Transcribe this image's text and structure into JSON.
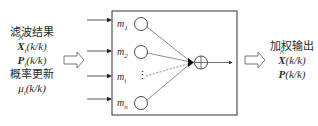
{
  "input": {
    "line1": "滤波结果",
    "x_symbol": "X",
    "x_sub": "i",
    "x_arg": "(k/k)",
    "p_symbol": "P",
    "p_sub": "i",
    "p_arg": "(k/k)",
    "line4": "概率更新",
    "mu_symbol": "μ",
    "mu_sub": "i",
    "mu_arg": "(k/k)"
  },
  "models": [
    {
      "symbol": "m",
      "sub": "1"
    },
    {
      "symbol": "m",
      "sub": "2"
    },
    {
      "symbol": "m",
      "sub": "i"
    },
    {
      "symbol": "m",
      "sub": "n"
    }
  ],
  "ellipsis": "⋮",
  "output": {
    "title": "加权输出",
    "x_symbol": "X",
    "x_arg": "(k/k)",
    "p_symbol": "P",
    "p_arg": "(k/k)"
  },
  "icons": {
    "summing_junction": "circle-plus",
    "hollow_arrow": "double-arrow-right"
  }
}
